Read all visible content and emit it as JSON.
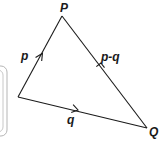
{
  "diagram": {
    "type": "vector-triangle",
    "vertices": {
      "origin": {
        "x": 18,
        "y": 97
      },
      "P": {
        "x": 62,
        "y": 16,
        "label": "P"
      },
      "Q": {
        "x": 147,
        "y": 128,
        "label": "Q"
      }
    },
    "edges": [
      {
        "from": "origin",
        "to": "P",
        "label": "p",
        "arrow_direction": "toward P"
      },
      {
        "from": "origin",
        "to": "Q",
        "label": "q",
        "arrow_direction": "toward Q"
      },
      {
        "from": "Q",
        "to": "P",
        "label": "p-q",
        "arrow_direction": "toward P"
      }
    ],
    "labels": {
      "P": "P",
      "Q": "Q",
      "p": "p",
      "q": "q",
      "p_minus_q": "p-q"
    },
    "colors": {
      "stroke": "#1a1a1a",
      "frame": "#b0b0b0"
    }
  }
}
